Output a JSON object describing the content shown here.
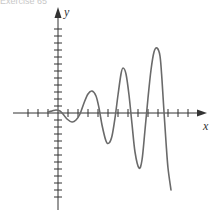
{
  "caption": "Exercise 65",
  "chart_data": {
    "type": "line",
    "title": "",
    "xlabel": "x",
    "ylabel": "y",
    "grid": false,
    "legend": null,
    "pixel_points": [
      [
        48,
        112
      ],
      [
        52,
        111
      ],
      [
        56,
        110
      ],
      [
        60,
        111
      ],
      [
        63,
        114
      ],
      [
        67,
        119
      ],
      [
        72,
        122
      ],
      [
        76,
        120
      ],
      [
        80,
        114
      ],
      [
        84,
        103
      ],
      [
        88,
        94
      ],
      [
        92,
        91
      ],
      [
        96,
        96
      ],
      [
        99,
        108
      ],
      [
        102,
        125
      ],
      [
        106,
        141
      ],
      [
        109,
        143
      ],
      [
        112,
        136
      ],
      [
        115,
        118
      ],
      [
        118,
        95
      ],
      [
        121,
        74
      ],
      [
        123,
        68
      ],
      [
        126,
        74
      ],
      [
        129,
        95
      ],
      [
        132,
        124
      ],
      [
        135,
        152
      ],
      [
        139,
        168
      ],
      [
        142,
        160
      ],
      [
        145,
        130
      ],
      [
        148,
        98
      ],
      [
        151,
        70
      ],
      [
        154,
        52
      ],
      [
        157,
        48
      ],
      [
        160,
        56
      ],
      [
        162,
        80
      ],
      [
        164,
        112
      ],
      [
        166,
        142
      ],
      [
        168,
        168
      ],
      [
        171,
        190
      ]
    ],
    "extrema": [
      {
        "kind": "max",
        "x_px": 92,
        "y_px": 91
      },
      {
        "kind": "min",
        "x_px": 108,
        "y_px": 144
      },
      {
        "kind": "max",
        "x_px": 123,
        "y_px": 68
      },
      {
        "kind": "min",
        "x_px": 139,
        "y_px": 168
      },
      {
        "kind": "max",
        "x_px": 157,
        "y_px": 48
      }
    ],
    "axes": {
      "origin_px": [
        58,
        113
      ],
      "x_axis": {
        "from_px": 13,
        "to_px": 207,
        "tick_spacing_px": 10
      },
      "y_axis": {
        "from_px": 210,
        "to_px": 7,
        "tick_spacing_px": 7
      }
    },
    "colors": {
      "curve": "#6a6a6a",
      "axis": "#333333"
    }
  }
}
